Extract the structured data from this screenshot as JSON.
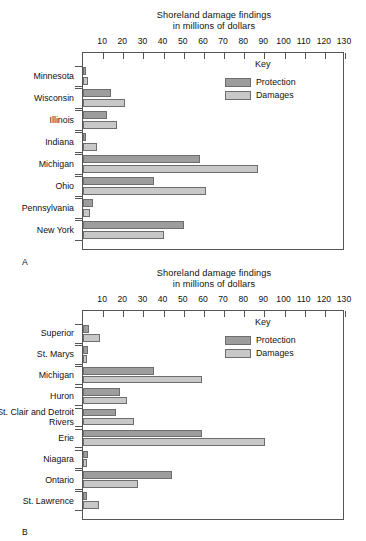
{
  "page": {
    "background_color": "#ffffff",
    "protection_color": "#9d9d9d",
    "damages_color": "#c8c8c8",
    "axis_color": "#555555"
  },
  "panel_a": {
    "letter": "A",
    "title_line1": "Shoreland damage findings",
    "title_line2": "in millions of dollars",
    "key": {
      "title": "Key",
      "items": [
        {
          "label": "Protection",
          "color": "#9d9d9d"
        },
        {
          "label": "Damages",
          "color": "#c8c8c8"
        }
      ]
    }
  },
  "panel_b": {
    "letter": "B",
    "title_line1": "Shoreland damage findings",
    "title_line2": "in millions of dollars",
    "key": {
      "title": "Key",
      "items": [
        {
          "label": "Protection",
          "color": "#9d9d9d"
        },
        {
          "label": "Damages",
          "color": "#c8c8c8"
        }
      ]
    }
  },
  "chart_data": [
    {
      "id": "panel-a",
      "type": "bar",
      "orientation": "horizontal",
      "title": "Shoreland damage findings in millions of dollars",
      "xlabel": "in millions of dollars",
      "ylabel": "",
      "xlim": [
        0,
        130
      ],
      "xticks": [
        10,
        20,
        30,
        40,
        50,
        60,
        70,
        80,
        90,
        100,
        110,
        120,
        130
      ],
      "grid": false,
      "legend": [
        "Protection",
        "Damages"
      ],
      "legend_position": "inside-top-right",
      "categories": [
        "Minnesota",
        "Wisconsin",
        "Illinois",
        "Indiana",
        "Michigan",
        "Ohio",
        "Pennsylvania",
        "New York"
      ],
      "series": [
        {
          "name": "Protection",
          "color": "#9d9d9d",
          "values": [
            1.5,
            14,
            12,
            1.5,
            58,
            35,
            5,
            50
          ]
        },
        {
          "name": "Damages",
          "color": "#c8c8c8",
          "values": [
            2.5,
            21,
            17,
            7,
            87,
            61,
            3.5,
            40
          ]
        }
      ]
    },
    {
      "id": "panel-b",
      "type": "bar",
      "orientation": "horizontal",
      "title": "Shoreland damage findings in millions of dollars",
      "xlabel": "in millions of dollars",
      "ylabel": "",
      "xlim": [
        0,
        130
      ],
      "xticks": [
        10,
        20,
        30,
        40,
        50,
        60,
        70,
        80,
        90,
        100,
        110,
        120,
        130
      ],
      "grid": false,
      "legend": [
        "Protection",
        "Damages"
      ],
      "legend_position": "inside-top-right",
      "categories": [
        "Superior",
        "St. Marys",
        "Michigan",
        "Huron",
        "St. Clair and Detroit Rivers",
        "Erie",
        "Niagara",
        "Ontario",
        "St. Lawrence"
      ],
      "series": [
        {
          "name": "Protection",
          "color": "#9d9d9d",
          "values": [
            3,
            2.5,
            35,
            18.5,
            16.5,
            59,
            2.5,
            44,
            2
          ]
        },
        {
          "name": "Damages",
          "color": "#c8c8c8",
          "values": [
            8.5,
            2,
            59,
            22,
            25.5,
            90.5,
            2,
            27.5,
            8
          ]
        }
      ]
    }
  ]
}
